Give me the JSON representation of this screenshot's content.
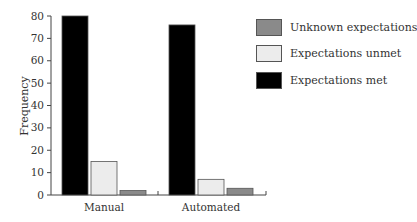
{
  "chart_data": {
    "type": "bar",
    "title": "",
    "xlabel": "",
    "ylabel": "Frequency",
    "ylim": [
      0,
      80
    ],
    "yticks": [
      0,
      10,
      20,
      30,
      40,
      50,
      60,
      70,
      80
    ],
    "grid": false,
    "legend_position": "right",
    "categories": [
      "Manual",
      "Automated"
    ],
    "series": [
      {
        "name": "Expectations met",
        "color": "#000000",
        "values": [
          80,
          76
        ]
      },
      {
        "name": "Expectations unmet",
        "color": "#ececec",
        "values": [
          15,
          7
        ]
      },
      {
        "name": "Unknown expectations",
        "color": "#8a8a8a",
        "values": [
          2,
          3
        ]
      }
    ]
  },
  "legend": {
    "items": [
      {
        "label": "Unknown expectations",
        "color": "#8a8a8a"
      },
      {
        "label": "Expectations unmet",
        "color": "#ececec"
      },
      {
        "label": "Expectations met",
        "color": "#000000"
      }
    ]
  }
}
